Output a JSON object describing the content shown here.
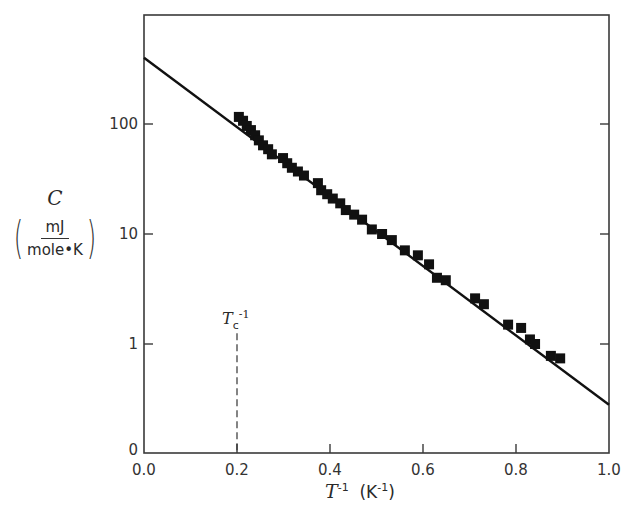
{
  "chart_data": {
    "type": "scatter",
    "title": "",
    "xlabel": "T^-1 (K^-1)",
    "xlabel_parts": {
      "symbol": "T",
      "exp": "-1",
      "unit_open": "(K",
      "unit_exp": "-1",
      "unit_close": ")"
    },
    "ylabel": "C (mJ / mole·K)",
    "ylabel_parts": {
      "symbol": "C",
      "unit_num": "mJ",
      "unit_den": "mole•K"
    },
    "yscale": "log",
    "xlim": [
      0.0,
      1.0
    ],
    "ylim": [
      0.1,
      800
    ],
    "grid": false,
    "legend": null,
    "x_ticks": [
      {
        "value": 0.0,
        "label": "0.0"
      },
      {
        "value": 0.2,
        "label": "0.2"
      },
      {
        "value": 0.4,
        "label": "0.4"
      },
      {
        "value": 0.6,
        "label": "0.6"
      },
      {
        "value": 0.8,
        "label": "0.8"
      },
      {
        "value": 1.0,
        "label": "1.0"
      }
    ],
    "y_ticks": [
      {
        "value": 0.1,
        "label": "0"
      },
      {
        "value": 1,
        "label": "1"
      },
      {
        "value": 10,
        "label": "10"
      },
      {
        "value": 100,
        "label": "100"
      }
    ],
    "series": [
      {
        "name": "measured C",
        "marker": "square",
        "color": "#111111",
        "x": [
          0.204,
          0.213,
          0.221,
          0.23,
          0.239,
          0.247,
          0.256,
          0.267,
          0.275,
          0.299,
          0.308,
          0.318,
          0.331,
          0.344,
          0.374,
          0.381,
          0.394,
          0.406,
          0.422,
          0.434,
          0.452,
          0.469,
          0.49,
          0.512,
          0.533,
          0.561,
          0.589,
          0.613,
          0.63,
          0.649,
          0.712,
          0.731,
          0.783,
          0.811,
          0.83,
          0.841,
          0.875,
          0.895
        ],
        "y": [
          116,
          107,
          96,
          88,
          79,
          71,
          64,
          59,
          53,
          49,
          44,
          40,
          37,
          34,
          29,
          25,
          23,
          21,
          19,
          16.5,
          15,
          13.5,
          11,
          10,
          8.8,
          7.1,
          6.4,
          5.3,
          4.0,
          3.8,
          2.6,
          2.3,
          1.5,
          1.4,
          1.1,
          1.0,
          0.78,
          0.74
        ]
      },
      {
        "name": "fit line",
        "type": "line",
        "color": "#111111",
        "x": [
          0.0,
          1.0
        ],
        "y": [
          400,
          0.28
        ]
      }
    ],
    "annotations": [
      {
        "text": "Tc^-1",
        "symbol": "T",
        "sub": "c",
        "sup": "-1",
        "x": 0.2,
        "style": "dashed vertical line",
        "y_top": 1.25
      }
    ]
  }
}
